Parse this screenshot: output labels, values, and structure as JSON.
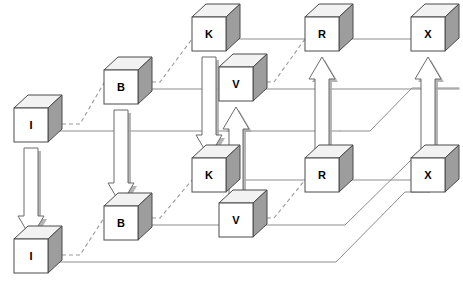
{
  "diagram": {
    "canvas": {
      "width": 463,
      "height": 297,
      "background": "#ffffff"
    },
    "style": {
      "cube_front_fill": "#ffffff",
      "cube_side_fill": "#9d9d9d",
      "cube_top_fill": "#f2f2f2",
      "cube_stroke": "#4a4a4a",
      "arrow_fill": "#ffffff",
      "arrow_stroke": "#6b6b6b",
      "arrow_shadow": "#a8a8a8",
      "solid_line": "#8d8d8d",
      "dashed_line": "#9a9a9a",
      "label_color": "#000000"
    },
    "cube_geometry": {
      "front_width": 34,
      "front_height": 34,
      "depth_x": 14,
      "depth_y": 13
    },
    "nodes": [
      {
        "id": "I_top",
        "label": "I",
        "x": 14,
        "y": 108,
        "plane": "front"
      },
      {
        "id": "I_bottom",
        "label": "I",
        "x": 14,
        "y": 239,
        "plane": "front"
      },
      {
        "id": "B_top",
        "label": "B",
        "x": 104,
        "y": 70,
        "plane": "back"
      },
      {
        "id": "B_bottom",
        "label": "B",
        "x": 104,
        "y": 206,
        "plane": "front"
      },
      {
        "id": "K_top",
        "label": "K",
        "x": 192,
        "y": 17,
        "plane": "back"
      },
      {
        "id": "K_mid",
        "label": "K",
        "x": 192,
        "y": 158,
        "plane": "front"
      },
      {
        "id": "V_top",
        "label": "V",
        "x": 219,
        "y": 67,
        "plane": "back"
      },
      {
        "id": "V_bottom",
        "label": "V",
        "x": 219,
        "y": 203,
        "plane": "front"
      },
      {
        "id": "R_top",
        "label": "R",
        "x": 305,
        "y": 17,
        "plane": "back"
      },
      {
        "id": "R_mid",
        "label": "R",
        "x": 305,
        "y": 158,
        "plane": "front"
      },
      {
        "id": "X_top",
        "label": "X",
        "x": 411,
        "y": 17,
        "plane": "back"
      },
      {
        "id": "X_mid",
        "label": "X",
        "x": 411,
        "y": 158,
        "plane": "front"
      }
    ],
    "block_arrows": [
      {
        "id": "arrow-I-top-to-I-bottom",
        "from": "I_top",
        "to": "I_bottom",
        "direction": "down",
        "x": 31,
        "y1": 148,
        "y2": 238,
        "shaft": 14,
        "head": 26
      },
      {
        "id": "arrow-B-top-to-B-bottom",
        "from": "B_top",
        "to": "B_bottom",
        "direction": "down",
        "x": 121,
        "y1": 110,
        "y2": 205,
        "shaft": 14,
        "head": 26
      },
      {
        "id": "arrow-K-top-to-K-mid",
        "from": "K_top",
        "to": "K_mid",
        "direction": "down",
        "x": 209,
        "y1": 57,
        "y2": 157,
        "shaft": 14,
        "head": 26
      },
      {
        "id": "arrow-V-bottom-to-V-top",
        "from": "V_bottom",
        "to": "V_top",
        "direction": "up",
        "x": 236,
        "y1": 203,
        "y2": 107,
        "shaft": 14,
        "head": 26
      },
      {
        "id": "arrow-R-mid-to-R-top",
        "from": "R_mid",
        "to": "R_top",
        "direction": "up",
        "x": 322,
        "y1": 158,
        "y2": 57,
        "shaft": 14,
        "head": 26
      },
      {
        "id": "arrow-X-mid-to-X-top",
        "from": "X_mid",
        "to": "X_top",
        "direction": "up",
        "x": 428,
        "y1": 158,
        "y2": 57,
        "shaft": 14,
        "head": 26
      }
    ],
    "solid_links": [
      {
        "id": "link-I-top-to-B-top-row",
        "points": "48,131 340,131"
      },
      {
        "id": "link-B-top-to-V-top",
        "points": "138,89 219,89"
      },
      {
        "id": "link-K-top-to-R-top",
        "points": "226,39 305,39"
      },
      {
        "id": "link-R-top-to-X-top",
        "points": "339,39 411,39"
      },
      {
        "id": "link-V-top-right",
        "points": "253,89 459,89"
      },
      {
        "id": "link-K-mid-to-R-mid",
        "points": "226,180 305,180"
      },
      {
        "id": "link-R-mid-to-X-mid",
        "points": "339,180 411,180"
      },
      {
        "id": "link-B-bottom-to-V-bottom",
        "points": "138,225 219,225"
      },
      {
        "id": "link-V-bottom-to-X-top",
        "points": "253,225 345,225 411,160 425,160"
      },
      {
        "id": "link-I-bottom-to-X-mid",
        "points": "48,262 336,262 405,192 430,192"
      },
      {
        "id": "link-V-top-to-X-top-b",
        "points": "340,131 370,131 412,88 459,88"
      }
    ],
    "dashed_links": [
      {
        "id": "dash-I-top-to-B-top",
        "points": "48,124 80,124 104,83"
      },
      {
        "id": "dash-B-top-to-K-top",
        "points": "138,82 160,82 192,39"
      },
      {
        "id": "dash-V-top-to-R-top",
        "points": "253,82 274,82 305,39"
      },
      {
        "id": "dash-I-bottom-to-B-bottom",
        "points": "48,255 80,255 104,218"
      },
      {
        "id": "dash-B-bottom-to-K-mid",
        "points": "138,218 160,218 192,180"
      },
      {
        "id": "dash-V-bottom-to-R-mid",
        "points": "253,218 274,218 305,180"
      }
    ]
  }
}
